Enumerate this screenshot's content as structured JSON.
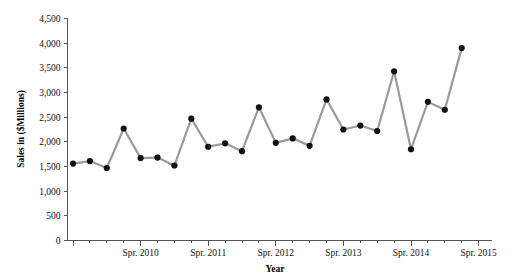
{
  "chart_data": {
    "type": "line",
    "title": "",
    "xlabel": "Year",
    "ylabel": "Sales in ($Millions)",
    "ylim": [
      0,
      4500
    ],
    "yticks": [
      0,
      500,
      1000,
      1500,
      2000,
      2500,
      3000,
      3500,
      4000,
      4500
    ],
    "ytick_labels": [
      "0",
      "500",
      "1,000",
      "1,500",
      "2,000",
      "2,500",
      "3,000",
      "3,500",
      "4,000",
      "4,500"
    ],
    "xtick_labels": [
      "Spr. 2010",
      "Spr. 2011",
      "Spr. 2012",
      "Spr. 2013",
      "Spr. 2014",
      "Spr. 2015"
    ],
    "xtick_label_positions": [
      4,
      8,
      12,
      16,
      20,
      24
    ],
    "grid": false,
    "legend": null,
    "marker": "circle",
    "marker_color": "#111111",
    "line_color": "#9a9a9a",
    "x": [
      0,
      1,
      2,
      3,
      4,
      5,
      6,
      7,
      8,
      9,
      10,
      11,
      12,
      13,
      14,
      15,
      16,
      17,
      18,
      19,
      20,
      21,
      22,
      23,
      24
    ],
    "values": [
      1560,
      1610,
      1470,
      2270,
      1670,
      1680,
      1520,
      2470,
      1900,
      1970,
      1810,
      2700,
      1980,
      2070,
      1920,
      2860,
      2250,
      2330,
      2220,
      3430,
      1850,
      2810,
      2650,
      3900
    ],
    "categories": [
      "Q1",
      "Q2",
      "Q3",
      "Spr. 2010",
      "Q1",
      "Q2",
      "Q3",
      "Spr. 2011",
      "Q1",
      "Q2",
      "Q3",
      "Spr. 2012",
      "Q1",
      "Q2",
      "Q3",
      "Spr. 2013",
      "Q1",
      "Q2",
      "Q3",
      "Spr. 2014",
      "Q1",
      "Q2",
      "Q3",
      "Spr. 2015"
    ]
  },
  "colors": {
    "line": "#9a9a9a",
    "marker": "#111111",
    "axis": "#555555",
    "text": "#111111",
    "background": "#ffffff"
  }
}
